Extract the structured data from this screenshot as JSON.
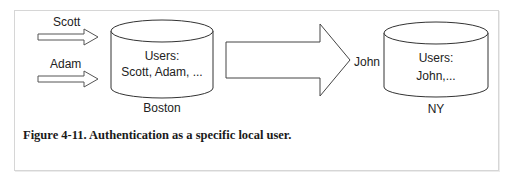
{
  "diagram": {
    "left_site": {
      "name": "Boston",
      "db_title": "Users:",
      "db_users": "Scott, Adam, ..."
    },
    "right_site": {
      "name": "NY",
      "db_title": "Users:",
      "db_users": "John,..."
    },
    "incoming_users": [
      {
        "label": "Scott"
      },
      {
        "label": "Adam"
      }
    ],
    "mapped_user": "John"
  },
  "caption": "Figure 4-11. Authentication as a specific local user."
}
